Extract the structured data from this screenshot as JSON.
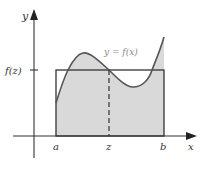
{
  "diagram": {
    "colors": {
      "axis": "#333333",
      "curve": "#555555",
      "fill": "#d9d9d9",
      "rectangle": "#333333",
      "label": "#333333",
      "curve_label": "#8a8a8a"
    },
    "axes": {
      "x_label": "x",
      "y_label": "y"
    },
    "labels": {
      "a": "a",
      "z": "z",
      "b": "b",
      "fz": "f(z)",
      "curve": "y = f(x)"
    },
    "geometry": {
      "origin": [
        34,
        136
      ],
      "x_a": 56,
      "x_z": 109,
      "x_b": 164,
      "y_fz": 70,
      "curve_points": [
        [
          56,
          103
        ],
        [
          62,
          85
        ],
        [
          68,
          70
        ],
        [
          75,
          58
        ],
        [
          83,
          53
        ],
        [
          92,
          56
        ],
        [
          100,
          62
        ],
        [
          109,
          70
        ],
        [
          118,
          79
        ],
        [
          126,
          85
        ],
        [
          133,
          87
        ],
        [
          141,
          86
        ],
        [
          148,
          80
        ],
        [
          152,
          70
        ],
        [
          157,
          60
        ],
        [
          161,
          48
        ],
        [
          164,
          37
        ]
      ]
    }
  }
}
